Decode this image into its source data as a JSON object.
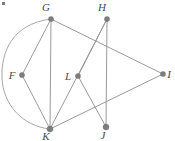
{
  "figure": {
    "width": 175,
    "height": 141,
    "background_color": "#ffffff",
    "edge_color": "#9a9a9a",
    "vertex_color": "#7d7d7d",
    "label_color": "#4a4a4a"
  },
  "corner_mark": {
    "name": "top-left-artifact",
    "x": 2,
    "y": 2,
    "width": 3,
    "height": 3,
    "color": "#7a7a7a"
  },
  "vertices": [
    {
      "id": "G",
      "label": "G",
      "x": 51,
      "y": 19,
      "r": 2.6,
      "label_x": 46,
      "label_y": 11
    },
    {
      "id": "H",
      "label": "H",
      "x": 107,
      "y": 19,
      "r": 2.6,
      "label_x": 102,
      "label_y": 11
    },
    {
      "id": "F",
      "label": "F",
      "x": 22,
      "y": 75,
      "r": 2.6,
      "label_x": 12,
      "label_y": 79
    },
    {
      "id": "L",
      "label": "L",
      "x": 78,
      "y": 76,
      "r": 2.6,
      "label_x": 68,
      "label_y": 80
    },
    {
      "id": "I",
      "label": "I",
      "x": 163,
      "y": 74,
      "r": 2.6,
      "label_x": 169,
      "label_y": 78
    },
    {
      "id": "K",
      "label": "K",
      "x": 50,
      "y": 129,
      "r": 3.0,
      "label_x": 46,
      "label_y": 140
    },
    {
      "id": "J",
      "label": "J",
      "x": 106,
      "y": 127,
      "r": 3.0,
      "label_x": 103,
      "label_y": 139
    }
  ],
  "edges": [
    {
      "id": "G-K",
      "from": "G",
      "to": "K",
      "type": "line",
      "x1": 51,
      "y1": 19,
      "x2": 50,
      "y2": 129
    },
    {
      "id": "G-I",
      "from": "G",
      "to": "I",
      "type": "line",
      "x1": 51,
      "y1": 19,
      "x2": 163,
      "y2": 74
    },
    {
      "id": "G-F",
      "from": "G",
      "to": "F",
      "type": "line",
      "x1": 51,
      "y1": 19,
      "x2": 22,
      "y2": 75
    },
    {
      "id": "F-K",
      "from": "F",
      "to": "K",
      "type": "line",
      "x1": 22,
      "y1": 75,
      "x2": 50,
      "y2": 129
    },
    {
      "id": "H-J",
      "from": "H",
      "to": "J",
      "type": "line",
      "x1": 107,
      "y1": 19,
      "x2": 106,
      "y2": 127
    },
    {
      "id": "H-K",
      "from": "H",
      "to": "K",
      "type": "line",
      "x1": 107,
      "y1": 19,
      "x2": 50,
      "y2": 129
    },
    {
      "id": "L-H",
      "from": "L",
      "to": "H",
      "type": "line",
      "x1": 78,
      "y1": 76,
      "x2": 107,
      "y2": 19
    },
    {
      "id": "L-J",
      "from": "L",
      "to": "J",
      "type": "line",
      "x1": 78,
      "y1": 76,
      "x2": 106,
      "y2": 127
    },
    {
      "id": "K-I",
      "from": "K",
      "to": "I",
      "type": "line",
      "x1": 50,
      "y1": 129,
      "x2": 163,
      "y2": 74
    },
    {
      "id": "G-K-arc",
      "from": "G",
      "to": "K",
      "type": "arc",
      "path": "M 51 19 C 12 24, 1 52, 2 78 C 3 104, 22 126, 50 129"
    }
  ]
}
